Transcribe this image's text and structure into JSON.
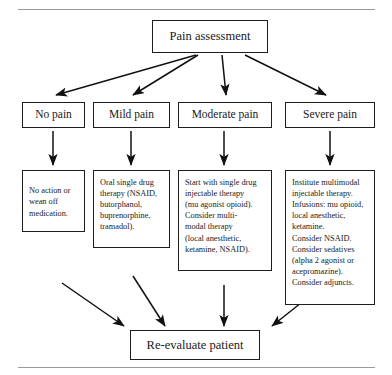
{
  "figure": {
    "kind": "flowchart",
    "orientation": "top-down",
    "rules": {
      "top_label": "top-divider-rule",
      "bottom_label": "bottom-divider-rule"
    }
  },
  "nodes": {
    "root": {
      "label": "Pain assessment"
    },
    "categories": [
      {
        "label": "No pain"
      },
      {
        "label": "Mild pain"
      },
      {
        "label": "Moderate pain"
      },
      {
        "label": "Severe pain"
      }
    ],
    "treatments": [
      {
        "label": "No action or\nwean off\nmedication."
      },
      {
        "label": "Oral single drug\ntherapy (NSAID,\nbutorphanol,\nbuprenorphine,\ntramadol)."
      },
      {
        "label": "Start with single drug\ninjectable therapy\n(mu agonist opioid).\nConsider multi-\nmodal therapy\n(local anesthetic,\nketamine, NSAID)."
      },
      {
        "label": "Institute multimodal\ninjectable therapy.\nInfusions: mu opioid,\nlocal anesthetic,\nketamine.\nConsider NSAID.\nConsider sedatives\n(alpha 2 agonist or\nacepromazine).\nConsider adjuncts."
      }
    ],
    "final": {
      "label": "Re-evaluate patient"
    }
  },
  "colors": {
    "border": "#1d1d1d",
    "arrow": "#111111",
    "rule": "#9a9a9a",
    "background": "#ffffff",
    "text": "#1a1a1a"
  }
}
